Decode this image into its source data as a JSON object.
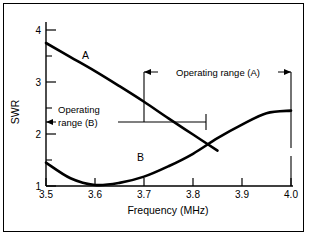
{
  "chart_data": {
    "type": "line",
    "title": "",
    "xlabel": "Frequency (MHz)",
    "ylabel": "SWR",
    "xlim": [
      3.5,
      4.0
    ],
    "ylim": [
      1,
      4
    ],
    "xticks": [
      "3.5",
      "3.6",
      "3.7",
      "3.8",
      "3.9",
      "4.0"
    ],
    "yticks": [
      "1",
      "2",
      "3",
      "4"
    ],
    "yminorticks": [
      "1.5",
      "2.5",
      "3.5"
    ],
    "grid": false,
    "legend_position": "inline-labels",
    "series": [
      {
        "name": "A",
        "label": "A",
        "points": [
          [
            3.5,
            3.75
          ],
          [
            3.55,
            3.48
          ],
          [
            3.6,
            3.21
          ],
          [
            3.65,
            2.92
          ],
          [
            3.7,
            2.62
          ],
          [
            3.75,
            2.3
          ],
          [
            3.8,
            1.99
          ],
          [
            3.85,
            1.68
          ],
          [
            3.9,
            2.45
          ]
        ]
      },
      {
        "name": "B",
        "label": "B",
        "points": [
          [
            3.5,
            1.45
          ],
          [
            3.55,
            1.15
          ],
          [
            3.6,
            1.02
          ],
          [
            3.65,
            1.06
          ],
          [
            3.7,
            1.18
          ],
          [
            3.75,
            1.38
          ],
          [
            3.8,
            1.62
          ],
          [
            3.85,
            1.92
          ],
          [
            3.9,
            2.18
          ],
          [
            3.95,
            2.4
          ],
          [
            4.0,
            2.45
          ]
        ]
      }
    ],
    "annotations": [
      {
        "id": "operating-range-a",
        "text": "Operating range (A)",
        "x_start": 3.7,
        "x_end": 4.0,
        "level": 3.25
      },
      {
        "id": "operating-range-b",
        "text_line1": "Operating",
        "text_line2": "range (B)",
        "x_start": 3.5,
        "x_end": 3.83,
        "level": 2.15
      }
    ]
  }
}
